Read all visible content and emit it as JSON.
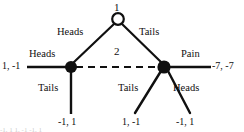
{
  "diagram": {
    "kind": "extensive-form game tree",
    "background_color": "#ffffff",
    "line_color": "#101010",
    "nodes": {
      "root": {
        "player_label": "1",
        "style": "hollow-circle",
        "x": 118,
        "y": 19,
        "r": 6
      },
      "left_decision": {
        "style": "filled-circle",
        "x": 71,
        "y": 67,
        "r": 6
      },
      "right_decision": {
        "style": "filled-circle",
        "x": 164,
        "y": 67,
        "r": 6.5
      }
    },
    "information_set": {
      "player_label": "2",
      "style": "dashed",
      "label_x": 117,
      "label_y": 52
    },
    "edges": {
      "root_left": {
        "label": "Heads",
        "label_x": 57,
        "label_y": 32
      },
      "root_right": {
        "label": "Tails",
        "label_x": 139,
        "label_y": 32
      },
      "left_heads": {
        "label": "Heads",
        "label_x": 29,
        "label_y": 54
      },
      "left_tails": {
        "label": "Tails",
        "label_x": 38,
        "label_y": 88
      },
      "right_pain": {
        "label": "Pain",
        "label_x": 182,
        "label_y": 54
      },
      "right_tails": {
        "label": "Tails",
        "label_x": 118,
        "label_y": 88
      },
      "right_heads": {
        "label": "Heads",
        "label_x": 174,
        "label_y": 88
      }
    },
    "payoffs": [
      {
        "id": "payoff-left-heads",
        "text": "1, -1",
        "x": 2,
        "y": 61
      },
      {
        "id": "payoff-left-tails",
        "text": "-1, 1",
        "x": 58,
        "y": 119
      },
      {
        "id": "payoff-right-tails",
        "text": "1, -1",
        "x": 122,
        "y": 119
      },
      {
        "id": "payoff-right-heads",
        "text": "-1, 1",
        "x": 176,
        "y": 119
      },
      {
        "id": "payoff-right-pain",
        "text": "-7, -7",
        "x": 212,
        "y": 61
      }
    ],
    "caption_fragment": "-1, 1            1, -1        -1, 1"
  }
}
